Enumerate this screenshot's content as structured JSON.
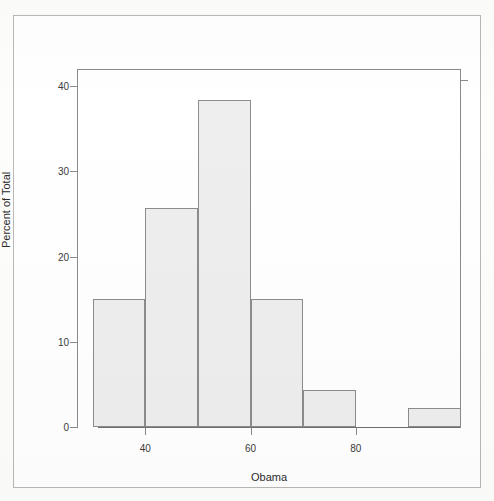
{
  "chart_data": {
    "type": "bar",
    "title": "",
    "xlabel": "Obama",
    "ylabel": "Percent of Total",
    "categories": [
      "30-40",
      "40-50",
      "50-60",
      "60-70",
      "70-80",
      "80-90",
      "90-100"
    ],
    "bin_edges": [
      30,
      40,
      50,
      60,
      70,
      80,
      90,
      100
    ],
    "values": [
      15.0,
      25.7,
      38.4,
      15.0,
      4.3,
      0.0,
      2.2
    ],
    "xlim": [
      27,
      100
    ],
    "ylim": [
      0,
      42
    ],
    "xticks": [
      40,
      60,
      80
    ],
    "yticks": [
      0,
      10,
      20,
      30,
      40
    ],
    "xtick_labels": [
      "40",
      "60",
      "80"
    ],
    "ytick_labels": [
      "0",
      "10",
      "20",
      "30",
      "40"
    ],
    "grid": false,
    "legend": false,
    "bar_fill_color": "#eeeeee",
    "bar_border_color": "#8c8c8a",
    "axis_color": "#8a8a88",
    "background_color": "#ffffff"
  },
  "figure": {
    "frame_border_color": "#b9b9b7"
  }
}
